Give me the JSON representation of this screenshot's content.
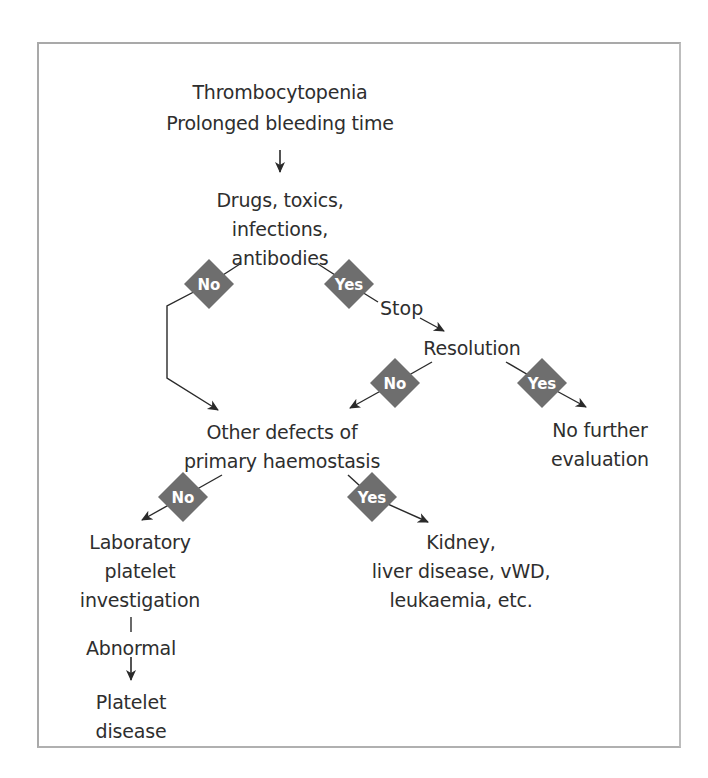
{
  "figure": {
    "frame_color": "#a9a9a9",
    "decision_color": "#6e6e6e",
    "arrow_color": "#2a2a2a",
    "text_color": "#2e2e2e"
  },
  "nodes": {
    "start": {
      "lines": [
        "Thrombocytopenia",
        "Prolonged bleeding time"
      ]
    },
    "drugs": {
      "lines": [
        "Drugs, toxics,",
        "infections,",
        "antibodies"
      ]
    },
    "stop": {
      "label": "Stop"
    },
    "resolution": {
      "label": "Resolution"
    },
    "no_further": {
      "lines": [
        "No further",
        "evaluation"
      ]
    },
    "other_defects": {
      "lines": [
        "Other defects of",
        "primary haemostasis"
      ]
    },
    "laboratory": {
      "lines": [
        "Laboratory",
        "platelet",
        "investigation"
      ]
    },
    "kidney": {
      "lines": [
        "Kidney,",
        "liver disease, vWD,",
        "leukaemia, etc."
      ]
    },
    "abnormal": {
      "label": "Abnormal"
    },
    "platelet_disease": {
      "lines": [
        "Platelet",
        "disease"
      ]
    }
  },
  "decisions": {
    "drugs_no": "No",
    "drugs_yes": "Yes",
    "resolution_no": "No",
    "resolution_yes": "Yes",
    "other_no": "No",
    "other_yes": "Yes"
  },
  "caption": {
    "text": ""
  }
}
